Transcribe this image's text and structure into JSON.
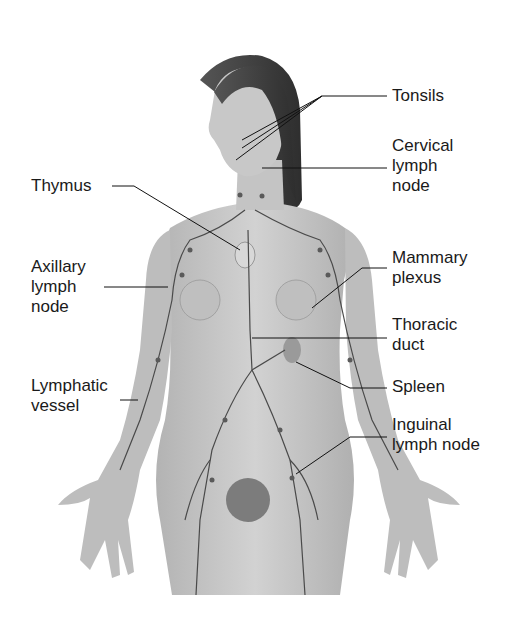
{
  "figure": {
    "colors": {
      "background": "#ffffff",
      "skin": "#c9c9c9",
      "skin_shadow": "#a8a8a8",
      "hair": "#3a3a3a",
      "vessel": "#4a4a4a",
      "leader": "#111111",
      "text": "#1a1a1a"
    }
  },
  "labels": {
    "tonsils": {
      "lines": [
        "Tonsils"
      ]
    },
    "cervical": {
      "lines": [
        "Cervical",
        "lymph",
        "node"
      ]
    },
    "thymus": {
      "lines": [
        "Thymus"
      ]
    },
    "axillary": {
      "lines": [
        "Axillary",
        "lymph",
        "node"
      ]
    },
    "mammary": {
      "lines": [
        "Mammary",
        "plexus"
      ]
    },
    "thoracic": {
      "lines": [
        "Thoracic",
        "duct"
      ]
    },
    "spleen": {
      "lines": [
        "Spleen"
      ]
    },
    "lymphatic": {
      "lines": [
        "Lymphatic",
        "vessel"
      ]
    },
    "inguinal": {
      "lines": [
        "Inguinal",
        "lymph node"
      ]
    }
  }
}
